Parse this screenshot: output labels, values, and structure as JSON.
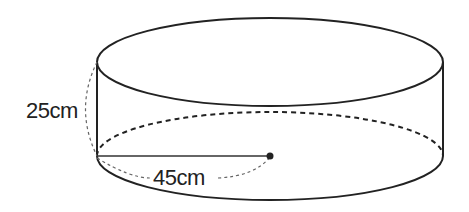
{
  "diagram": {
    "shape": "cylinder",
    "height_label": "25cm",
    "radius_label": "45cm",
    "stroke_color": "#222222",
    "background": "#ffffff"
  }
}
